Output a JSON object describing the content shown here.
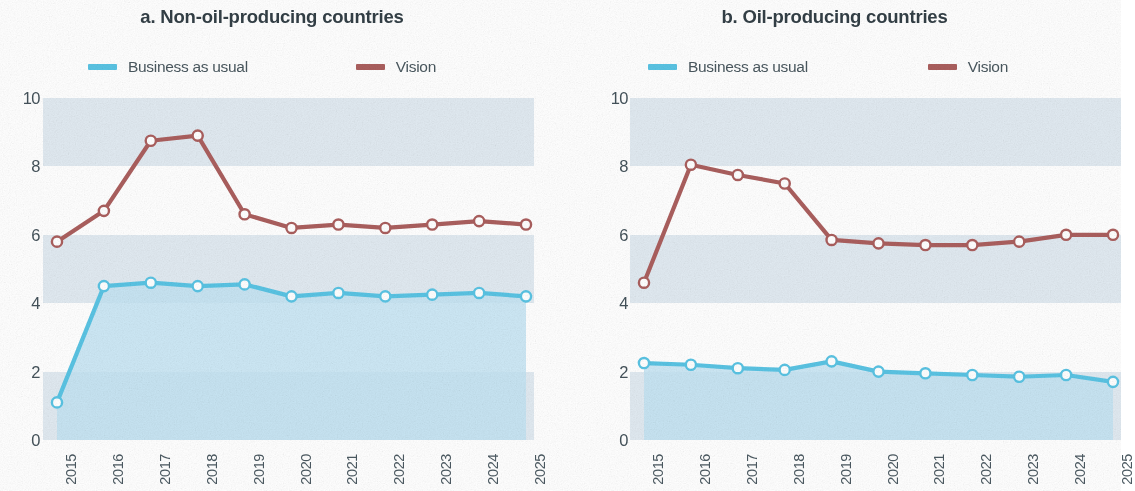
{
  "figure": {
    "panels": [
      {
        "id": "a",
        "title": "a. Non-oil-producing countries",
        "legend": [
          {
            "label": "Business as usual",
            "color": "#5ac4e4",
            "key": "bau"
          },
          {
            "label": "Vision",
            "color": "#ab5f5e",
            "key": "vision"
          }
        ]
      },
      {
        "id": "b",
        "title": "b. Oil-producing countries",
        "legend": [
          {
            "label": "Business as usual",
            "color": "#5ac4e4",
            "key": "bau"
          },
          {
            "label": "Vision",
            "color": "#ab5f5e",
            "key": "vision"
          }
        ]
      }
    ]
  },
  "axis": {
    "yticks": [
      "10",
      "8",
      "6",
      "4",
      "2",
      "0"
    ],
    "xticks": [
      "2015",
      "2016",
      "2017",
      "2018",
      "2019",
      "2020",
      "2021",
      "2022",
      "2023",
      "2024",
      "2025"
    ]
  },
  "colors": {
    "vision_line": "#ab5f5e",
    "bau_line": "#5ac4e4",
    "bau_fill": "#bfe2f2",
    "band": "#cfdde8",
    "marker_fill": "#ffffff",
    "text": "#44525a",
    "title": "#333f46"
  },
  "chart_data": [
    {
      "type": "line",
      "title": "a. Non-oil-producing countries",
      "xlabel": "",
      "ylabel": "",
      "ylim": [
        0,
        10
      ],
      "yticks": [
        0,
        2,
        4,
        6,
        8,
        10
      ],
      "grid": "horizontal-bands",
      "legend_position": "top",
      "categories": [
        "2015",
        "2016",
        "2017",
        "2018",
        "2019",
        "2020",
        "2021",
        "2022",
        "2023",
        "2024",
        "2025"
      ],
      "series": [
        {
          "name": "Business as usual",
          "color": "#5ac4e4",
          "filled": true,
          "values": [
            1.1,
            4.5,
            4.6,
            4.5,
            4.55,
            4.2,
            4.3,
            4.2,
            4.25,
            4.3,
            4.2
          ]
        },
        {
          "name": "Vision",
          "color": "#ab5f5e",
          "filled": false,
          "values": [
            5.8,
            6.7,
            8.75,
            8.9,
            6.6,
            6.2,
            6.3,
            6.2,
            6.3,
            6.4,
            6.3
          ]
        }
      ]
    },
    {
      "type": "line",
      "title": "b. Oil-producing countries",
      "xlabel": "",
      "ylabel": "",
      "ylim": [
        0,
        10
      ],
      "yticks": [
        0,
        2,
        4,
        6,
        8,
        10
      ],
      "grid": "horizontal-bands",
      "legend_position": "top",
      "categories": [
        "2015",
        "2016",
        "2017",
        "2018",
        "2019",
        "2020",
        "2021",
        "2022",
        "2023",
        "2024",
        "2025"
      ],
      "series": [
        {
          "name": "Business as usual",
          "color": "#5ac4e4",
          "filled": true,
          "values": [
            2.25,
            2.2,
            2.1,
            2.05,
            2.3,
            2.0,
            1.95,
            1.9,
            1.85,
            1.9,
            1.7
          ]
        },
        {
          "name": "Vision",
          "color": "#ab5f5e",
          "filled": false,
          "values": [
            4.6,
            8.05,
            7.75,
            7.5,
            5.85,
            5.75,
            5.7,
            5.7,
            5.8,
            6.0,
            6.0
          ]
        }
      ]
    }
  ]
}
